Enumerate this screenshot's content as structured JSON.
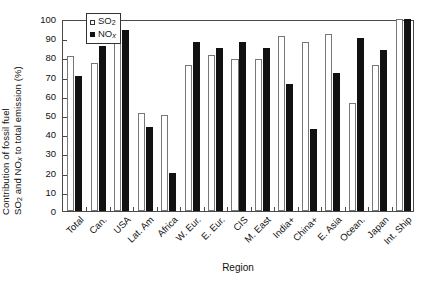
{
  "chart_data": {
    "type": "bar",
    "title": "",
    "xlabel": "Region",
    "ylabel_line1": "Contribution of fossil fuel",
    "ylabel_line2": "SO2 and NOx to total emission (%)",
    "ylim": [
      0,
      100
    ],
    "yticks": [
      100,
      90,
      80,
      70,
      60,
      50,
      40,
      30,
      20,
      10,
      0
    ],
    "grid": false,
    "legend_position": "top-center-left",
    "categories": [
      "Total",
      "Can.",
      "USA",
      "Lat. Am",
      "Africa",
      "W. Eur.",
      "E. Eur.",
      "CIS",
      "M. East",
      "India+",
      "China+",
      "E. Asia",
      "Ocean.",
      "Japan",
      "Int. Ship"
    ],
    "series": [
      {
        "name": "SO2",
        "style": "open",
        "color": "#ffffff",
        "values": [
          80.5,
          77,
          94.5,
          51,
          50,
          76,
          81,
          79,
          79,
          91,
          88,
          92,
          56,
          76,
          100
        ]
      },
      {
        "name": "NOx",
        "style": "filled",
        "color": "#111111",
        "values": [
          70.5,
          86,
          94.5,
          44,
          20,
          88,
          85,
          88,
          85,
          66,
          42.5,
          72,
          90,
          84,
          100
        ]
      }
    ]
  },
  "legend": {
    "entries": [
      {
        "label_main": "SO",
        "label_sub": "2",
        "label_ital": "",
        "style": "open"
      },
      {
        "label_main": "NO",
        "label_sub": "",
        "label_ital": "x",
        "style": "filled"
      }
    ]
  },
  "axis": {
    "x_title": "Region",
    "y_title_line1": "Contribution of fossil fuel",
    "y_title_line2_a": "SO",
    "y_title_line2_sub": "2",
    "y_title_line2_b": " and NO",
    "y_title_line2_ital": "x",
    "y_title_line2_c": " to total emission (%)"
  }
}
